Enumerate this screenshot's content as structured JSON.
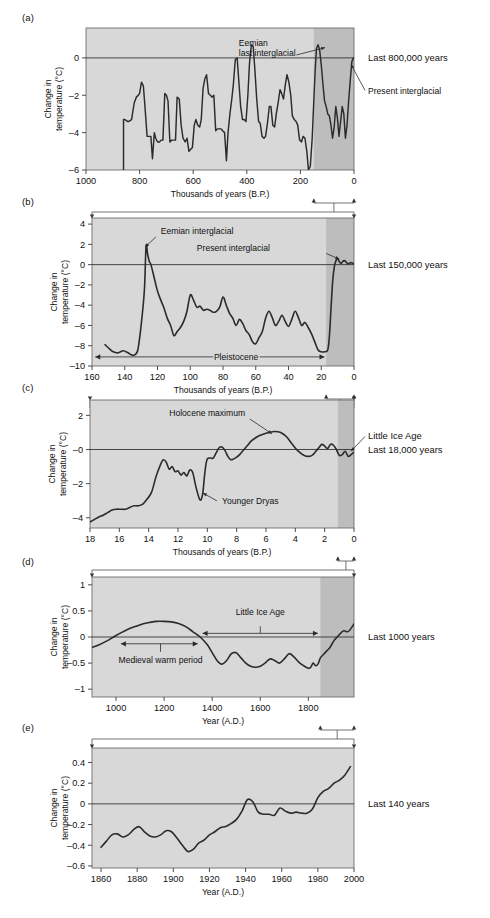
{
  "figure": {
    "ylabel": "Change in temperature (°C)",
    "xlabel_bp": "Thousands of years (B.P.)",
    "xlabel_ad": "Year (A.D.)",
    "colors": {
      "plot_background": "#d8d8d8",
      "plot_background_highlight": "#bdbdbd",
      "curve": "#2b2b2b",
      "frame": "#6e6e6e",
      "page_background": "#ffffff"
    }
  },
  "panels": [
    {
      "letter": "(a)",
      "side_label": "Last 800,000 years",
      "annotations": [
        {
          "text": "Eemian",
          "name": "eemian-label-line1"
        },
        {
          "text": "last interglacial",
          "name": "eemian-label-line2"
        },
        {
          "text": "Present interglacial",
          "name": "present-interglacial-label"
        }
      ]
    },
    {
      "letter": "(b)",
      "side_label": "Last 150,000 years",
      "annotations": [
        {
          "text": "Eemian interglacial",
          "name": "eemian-interglacial-label"
        },
        {
          "text": "Present interglacial",
          "name": "present-interglacial-label"
        },
        {
          "text": "Pleistocene",
          "name": "pleistocene-label"
        }
      ]
    },
    {
      "letter": "(c)",
      "side_label_1": "Little Ice Age",
      "side_label_2": "Last 18,000 years",
      "annotations": [
        {
          "text": "Holocene maximum",
          "name": "holocene-maximum-label"
        },
        {
          "text": "Younger Dryas",
          "name": "younger-dryas-label"
        }
      ]
    },
    {
      "letter": "(d)",
      "side_label": "Last 1000 years",
      "annotations": [
        {
          "text": "Little Ice Age",
          "name": "little-ice-age-label"
        },
        {
          "text": "Medieval warm period",
          "name": "medieval-warm-period-label"
        }
      ]
    },
    {
      "letter": "(e)",
      "side_label": "Last 140 years",
      "annotations": []
    }
  ],
  "chart_data": [
    {
      "id": "panel-a",
      "type": "line",
      "title": "Last 800,000 years",
      "xlabel": "Thousands of years (B.P.)",
      "ylabel": "Change in temperature (°C)",
      "xlim": [
        1000,
        0
      ],
      "ylim": [
        -6,
        1.6
      ],
      "xticks": [
        1000,
        800,
        600,
        400,
        200,
        0
      ],
      "yticks": [
        0,
        -2,
        -4,
        -6
      ],
      "x_reversed": true,
      "grid": false,
      "highlight_span": [
        150,
        0
      ],
      "x": [
        860,
        860,
        855,
        845,
        840,
        830,
        820,
        812,
        805,
        800,
        793,
        786,
        780,
        772,
        765,
        758,
        752,
        745,
        740,
        733,
        726,
        720,
        713,
        706,
        700,
        694,
        687,
        680,
        673,
        666,
        660,
        652,
        645,
        638,
        630,
        623,
        616,
        610,
        603,
        596,
        590,
        583,
        576,
        570,
        563,
        556,
        550,
        543,
        536,
        530,
        523,
        516,
        510,
        503,
        496,
        490,
        483,
        476,
        470,
        463,
        456,
        450,
        443,
        436,
        430,
        423,
        416,
        410,
        403,
        396,
        390,
        383,
        376,
        370,
        363,
        356,
        350,
        343,
        336,
        330,
        323,
        316,
        310,
        303,
        296,
        290,
        283,
        276,
        270,
        263,
        256,
        250,
        243,
        236,
        230,
        223,
        216,
        210,
        203,
        196,
        190,
        183,
        176,
        170,
        163,
        156,
        150,
        145,
        140,
        134,
        128,
        122,
        116,
        110,
        104,
        98,
        92,
        86,
        80,
        74,
        68,
        62,
        56,
        50,
        44,
        38,
        32,
        26,
        20,
        14,
        8,
        2,
        0
      ],
      "y": [
        -6.0,
        -3.3,
        -3.3,
        -3.4,
        -3.4,
        -3.3,
        -2.4,
        -2.1,
        -2.0,
        -1.9,
        -1.3,
        -1.5,
        -2.6,
        -4.2,
        -4.2,
        -4.2,
        -5.4,
        -4.0,
        -4.3,
        -4.5,
        -4.5,
        -4.4,
        -4.4,
        -1.9,
        -2.0,
        -2.3,
        -4.5,
        -4.4,
        -4.4,
        -4.4,
        -2.1,
        -2.2,
        -3.6,
        -4.3,
        -4.5,
        -4.3,
        -5.0,
        -4.9,
        -4.8,
        -3.6,
        -3.3,
        -3.6,
        -3.7,
        -3.3,
        -1.6,
        -1.1,
        -0.9,
        -1.9,
        -2.0,
        -2.1,
        -2.0,
        -3.9,
        -3.8,
        -3.8,
        -3.8,
        -3.9,
        -4.0,
        -5.5,
        -4.0,
        -3.0,
        -2.2,
        -1.4,
        -0.1,
        0.0,
        -1.2,
        -2.6,
        -3.3,
        -3.3,
        -3.4,
        -2.0,
        -0.3,
        0.7,
        0.6,
        -0.6,
        -2.2,
        -3.4,
        -3.5,
        -4.2,
        -4.3,
        -4.2,
        -3.5,
        -2.6,
        -2.6,
        -3.6,
        -3.7,
        -3.0,
        -2.4,
        -1.7,
        -1.9,
        -2.2,
        -1.4,
        -0.9,
        -1.3,
        -2.0,
        -3.1,
        -3.3,
        -3.4,
        -3.6,
        -4.4,
        -4.5,
        -4.2,
        -4.3,
        -5.0,
        -6.0,
        -5.8,
        -4.3,
        -2.3,
        -0.7,
        0.5,
        0.7,
        0.4,
        -0.4,
        -1.4,
        -2.3,
        -2.6,
        -3.0,
        -3.1,
        -3.6,
        -4.3,
        -3.7,
        -2.6,
        -3.2,
        -4.2,
        -3.4,
        -2.6,
        -3.0,
        -4.3,
        -3.6,
        -2.3,
        -1.2,
        -0.2,
        0.0
      ]
    },
    {
      "id": "panel-b",
      "type": "line",
      "title": "Last 150,000 years",
      "xlabel": "Thousands of years (B.P.)",
      "ylabel": "Change in temperature (°C)",
      "xlim": [
        160,
        0
      ],
      "ylim": [
        -10,
        4.6
      ],
      "xticks": [
        160,
        140,
        120,
        100,
        80,
        60,
        40,
        20,
        0
      ],
      "yticks": [
        4,
        2,
        0,
        -2,
        -4,
        -6,
        -8,
        -10
      ],
      "x_reversed": true,
      "grid": false,
      "highlight_span": [
        17,
        0
      ],
      "x": [
        152,
        150,
        147,
        144,
        141,
        138,
        136,
        134,
        132,
        130,
        128,
        127,
        126,
        125,
        124,
        122,
        120,
        118,
        116,
        114,
        112,
        110,
        108,
        106,
        104,
        102,
        100,
        98,
        96,
        94,
        92,
        90,
        88,
        86,
        84,
        82,
        80,
        78,
        76,
        74,
        72,
        70,
        68,
        66,
        64,
        62,
        60,
        58,
        56,
        54,
        52,
        50,
        48,
        46,
        44,
        42,
        40,
        38,
        36,
        34,
        32,
        30,
        28,
        26,
        24,
        22,
        20,
        18,
        16,
        15,
        14,
        13,
        12,
        11,
        10,
        9,
        8,
        7,
        6,
        5,
        4,
        3,
        2,
        1,
        0
      ],
      "y": [
        -7.9,
        -8.2,
        -8.6,
        -8.7,
        -8.5,
        -8.7,
        -8.9,
        -8.9,
        -8.4,
        -6.0,
        -2.5,
        1.8,
        1.0,
        0.3,
        0.0,
        -1.3,
        -2.6,
        -3.5,
        -4.3,
        -5.3,
        -6.0,
        -7.0,
        -6.6,
        -6.2,
        -5.6,
        -4.6,
        -3.0,
        -3.5,
        -4.2,
        -4.1,
        -4.5,
        -4.4,
        -4.5,
        -4.7,
        -4.6,
        -4.2,
        -3.2,
        -4.0,
        -4.8,
        -5.3,
        -6.0,
        -5.4,
        -5.8,
        -6.5,
        -6.9,
        -7.6,
        -7.8,
        -7.2,
        -6.6,
        -5.3,
        -4.6,
        -5.2,
        -6.0,
        -5.6,
        -5.0,
        -5.6,
        -6.1,
        -5.4,
        -4.6,
        -5.2,
        -6.0,
        -5.7,
        -6.2,
        -6.8,
        -7.6,
        -8.4,
        -8.6,
        -8.6,
        -8.4,
        -7.0,
        -4.2,
        -1.6,
        -0.2,
        0.4,
        0.6,
        0.3,
        0.1,
        0.3,
        0.4,
        0.3,
        0.1,
        0.1,
        0.2,
        0.15,
        0.1
      ]
    },
    {
      "id": "panel-c",
      "type": "line",
      "title": "Last 18,000 years",
      "xlabel": "Thousands of years (B.P.)",
      "ylabel": "Change in temperature (°C)",
      "xlim": [
        18,
        0
      ],
      "ylim": [
        -4.6,
        2.9
      ],
      "xticks": [
        18,
        16,
        14,
        12,
        10,
        8,
        6,
        4,
        2,
        0
      ],
      "yticks": [
        2,
        0,
        -2,
        -4
      ],
      "x_reversed": true,
      "grid": false,
      "highlight_span": [
        1.1,
        0
      ],
      "x": [
        18.0,
        17.7,
        17.4,
        17.1,
        16.8,
        16.5,
        16.2,
        15.9,
        15.6,
        15.3,
        15.0,
        14.7,
        14.4,
        14.1,
        13.8,
        13.5,
        13.2,
        13.0,
        12.8,
        12.6,
        12.4,
        12.2,
        12.0,
        11.8,
        11.6,
        11.4,
        11.2,
        11.0,
        10.8,
        10.6,
        10.5,
        10.4,
        10.3,
        10.2,
        10.1,
        10.0,
        9.8,
        9.6,
        9.4,
        9.2,
        9.0,
        8.8,
        8.6,
        8.4,
        8.2,
        8.0,
        7.8,
        7.6,
        7.4,
        7.2,
        7.0,
        6.6,
        6.2,
        5.8,
        5.4,
        5.0,
        4.6,
        4.2,
        3.8,
        3.4,
        3.0,
        2.8,
        2.6,
        2.4,
        2.2,
        2.0,
        1.8,
        1.6,
        1.4,
        1.2,
        1.0,
        0.8,
        0.6,
        0.4,
        0.2,
        0.0
      ],
      "y": [
        -4.25,
        -4.1,
        -3.95,
        -3.85,
        -3.7,
        -3.55,
        -3.5,
        -3.5,
        -3.5,
        -3.4,
        -3.3,
        -3.3,
        -3.2,
        -2.9,
        -2.5,
        -1.6,
        -0.9,
        -0.6,
        -0.75,
        -1.15,
        -1.0,
        -1.3,
        -1.25,
        -1.5,
        -1.35,
        -1.55,
        -1.2,
        -1.35,
        -2.1,
        -2.75,
        -2.95,
        -2.9,
        -2.5,
        -1.6,
        -0.9,
        -0.55,
        -0.5,
        -0.5,
        -0.2,
        0.1,
        0.15,
        -0.05,
        -0.4,
        -0.6,
        -0.55,
        -0.45,
        -0.3,
        -0.1,
        0.1,
        0.3,
        0.5,
        0.75,
        0.9,
        1.0,
        1.05,
        1.0,
        0.75,
        0.3,
        -0.1,
        -0.35,
        -0.4,
        -0.3,
        -0.1,
        0.1,
        0.3,
        0.2,
        0.05,
        0.3,
        0.25,
        0.0,
        -0.35,
        -0.3,
        -0.1,
        -0.4,
        -0.3,
        -0.15
      ]
    },
    {
      "id": "panel-d",
      "type": "line",
      "title": "Last 1000 years",
      "xlabel": "Year (A.D.)",
      "ylabel": "Change in temperature (°C)",
      "xlim": [
        900,
        1990
      ],
      "ylim": [
        -1.15,
        1.15
      ],
      "xticks": [
        1000,
        1200,
        1400,
        1600,
        1800
      ],
      "yticks": [
        1,
        0.5,
        0,
        -0.5,
        -1
      ],
      "x_reversed": false,
      "grid": false,
      "highlight_span": [
        1850,
        1990
      ],
      "x": [
        900,
        930,
        960,
        990,
        1020,
        1050,
        1080,
        1110,
        1140,
        1170,
        1200,
        1230,
        1260,
        1290,
        1320,
        1350,
        1380,
        1400,
        1420,
        1440,
        1460,
        1480,
        1500,
        1520,
        1540,
        1560,
        1580,
        1600,
        1620,
        1640,
        1660,
        1680,
        1700,
        1720,
        1740,
        1760,
        1780,
        1800,
        1810,
        1820,
        1830,
        1840,
        1850,
        1860,
        1870,
        1880,
        1890,
        1900,
        1910,
        1920,
        1930,
        1940,
        1950,
        1960,
        1970,
        1980,
        1990
      ],
      "y": [
        -0.2,
        -0.15,
        -0.08,
        0.0,
        0.08,
        0.15,
        0.2,
        0.25,
        0.28,
        0.3,
        0.3,
        0.29,
        0.26,
        0.2,
        0.1,
        0.0,
        -0.15,
        -0.3,
        -0.45,
        -0.52,
        -0.45,
        -0.32,
        -0.3,
        -0.4,
        -0.5,
        -0.56,
        -0.58,
        -0.56,
        -0.5,
        -0.42,
        -0.45,
        -0.5,
        -0.42,
        -0.32,
        -0.38,
        -0.48,
        -0.55,
        -0.6,
        -0.58,
        -0.5,
        -0.55,
        -0.52,
        -0.4,
        -0.35,
        -0.3,
        -0.25,
        -0.2,
        -0.12,
        -0.05,
        0.0,
        0.05,
        0.1,
        0.12,
        0.1,
        0.12,
        0.18,
        0.25
      ]
    },
    {
      "id": "panel-e",
      "type": "line",
      "title": "Last 140 years",
      "xlabel": "Year (A.D.)",
      "ylabel": "Change in temperature (°C)",
      "xlim": [
        1855,
        2000
      ],
      "ylim": [
        -0.62,
        0.54
      ],
      "xticks": [
        1860,
        1880,
        1900,
        1920,
        1940,
        1960,
        1980,
        2000
      ],
      "yticks": [
        0.4,
        0.2,
        0,
        -0.2,
        -0.4,
        -0.6
      ],
      "x_reversed": false,
      "grid": false,
      "x": [
        1860,
        1863,
        1866,
        1869,
        1872,
        1875,
        1878,
        1881,
        1884,
        1887,
        1890,
        1893,
        1896,
        1899,
        1902,
        1905,
        1908,
        1911,
        1914,
        1917,
        1920,
        1923,
        1926,
        1929,
        1932,
        1935,
        1938,
        1941,
        1944,
        1947,
        1950,
        1953,
        1956,
        1959,
        1962,
        1965,
        1968,
        1971,
        1974,
        1977,
        1980,
        1983,
        1986,
        1989,
        1992,
        1995,
        1998
      ],
      "y": [
        -0.42,
        -0.36,
        -0.3,
        -0.29,
        -0.32,
        -0.3,
        -0.25,
        -0.22,
        -0.27,
        -0.31,
        -0.32,
        -0.3,
        -0.26,
        -0.27,
        -0.33,
        -0.4,
        -0.46,
        -0.44,
        -0.38,
        -0.35,
        -0.3,
        -0.27,
        -0.23,
        -0.22,
        -0.19,
        -0.15,
        -0.07,
        0.04,
        0.02,
        -0.08,
        -0.1,
        -0.1,
        -0.11,
        -0.04,
        -0.07,
        -0.09,
        -0.08,
        -0.09,
        -0.09,
        -0.05,
        0.06,
        0.12,
        0.15,
        0.2,
        0.23,
        0.28,
        0.36
      ]
    }
  ]
}
